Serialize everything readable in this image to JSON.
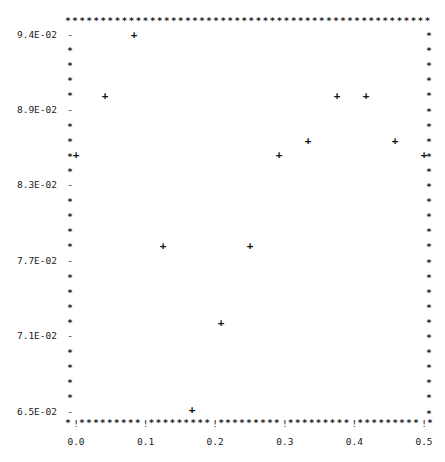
{
  "chart_data": {
    "type": "scatter",
    "title": "",
    "xlabel": "",
    "ylabel": "",
    "marker": "+",
    "border_char": "*",
    "x_tick_char": "!",
    "y_tick_char": "-",
    "xlim": [
      0.0,
      0.5
    ],
    "ylim": [
      0.065,
      0.094
    ],
    "x_ticks": [
      "0.0",
      "0.1",
      "0.2",
      "0.3",
      "0.4",
      "0.5"
    ],
    "x_tick_values": [
      0.0,
      0.1,
      0.2,
      0.3,
      0.4,
      0.5
    ],
    "y_ticks": [
      "9.4E-02",
      "8.9E-02",
      "8.3E-02",
      "7.7E-02",
      "7.1E-02",
      "6.5E-02"
    ],
    "y_tick_values": [
      0.094,
      0.0882,
      0.0824,
      0.0766,
      0.0708,
      0.065
    ],
    "grid": false,
    "legend": null,
    "x": [
      0.0,
      0.0417,
      0.0833,
      0.125,
      0.1667,
      0.2083,
      0.25,
      0.2917,
      0.3333,
      0.375,
      0.4167,
      0.4583,
      0.5
    ],
    "y": [
      0.0847,
      0.0893,
      0.094,
      0.0777,
      0.0651,
      0.0718,
      0.0777,
      0.0847,
      0.0858,
      0.0893,
      0.0893,
      0.0858,
      0.0847
    ]
  }
}
